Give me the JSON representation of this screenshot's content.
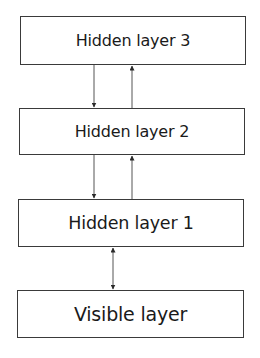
{
  "diagram": {
    "type": "layered-stack",
    "layers": [
      {
        "id": "hidden-3",
        "label": "Hidden layer 3"
      },
      {
        "id": "hidden-2",
        "label": "Hidden layer 2"
      },
      {
        "id": "hidden-1",
        "label": "Hidden layer 1"
      },
      {
        "id": "visible",
        "label": "Visible layer"
      }
    ],
    "connections": [
      {
        "from": "Hidden layer 3",
        "to": "Hidden layer 2",
        "direction": "down"
      },
      {
        "from": "Hidden layer 2",
        "to": "Hidden layer 3",
        "direction": "up"
      },
      {
        "from": "Hidden layer 2",
        "to": "Hidden layer 1",
        "direction": "down"
      },
      {
        "from": "Hidden layer 1",
        "to": "Hidden layer 2",
        "direction": "up"
      },
      {
        "from": "Hidden layer 1",
        "to": "Visible layer",
        "direction": "bidirectional"
      }
    ],
    "colors": {
      "stroke": "#3a3a3a",
      "background": "#ffffff",
      "text": "#1a1a1a"
    }
  }
}
